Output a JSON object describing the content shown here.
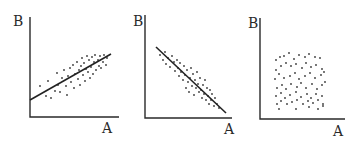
{
  "chart_data": [
    {
      "type": "scatter",
      "title": "",
      "xlabel": "A",
      "ylabel": "B",
      "relationship": "positive correlation",
      "trendline": true,
      "grid": false,
      "frame": {
        "x0": 30,
        "y0": 117,
        "xmax": 119,
        "ytop": 17
      },
      "line": {
        "x1": 30,
        "y1": 100,
        "x2": 111,
        "y2": 54
      },
      "points": [
        [
          40,
          86
        ],
        [
          46,
          96
        ],
        [
          48,
          81
        ],
        [
          51,
          98
        ],
        [
          55,
          91
        ],
        [
          57,
          73
        ],
        [
          58,
          85
        ],
        [
          60,
          92
        ],
        [
          62,
          78
        ],
        [
          64,
          70
        ],
        [
          66,
          86
        ],
        [
          67,
          95
        ],
        [
          68,
          76
        ],
        [
          70,
          68
        ],
        [
          71,
          82
        ],
        [
          73,
          65
        ],
        [
          74,
          88
        ],
        [
          75,
          74
        ],
        [
          77,
          62
        ],
        [
          78,
          79
        ],
        [
          79,
          70
        ],
        [
          80,
          85
        ],
        [
          81,
          66
        ],
        [
          82,
          58
        ],
        [
          83,
          75
        ],
        [
          84,
          63
        ],
        [
          85,
          81
        ],
        [
          86,
          69
        ],
        [
          87,
          56
        ],
        [
          88,
          72
        ],
        [
          89,
          60
        ],
        [
          90,
          78
        ],
        [
          91,
          67
        ],
        [
          92,
          57
        ],
        [
          93,
          74
        ],
        [
          94,
          62
        ],
        [
          95,
          55
        ],
        [
          96,
          70
        ],
        [
          98,
          60
        ],
        [
          99,
          66
        ],
        [
          100,
          56
        ],
        [
          101,
          68
        ],
        [
          103,
          62
        ],
        [
          104,
          55
        ],
        [
          106,
          65
        ],
        [
          107,
          58
        ]
      ]
    },
    {
      "type": "scatter",
      "title": "",
      "xlabel": "A",
      "ylabel": "B",
      "relationship": "negative correlation",
      "trendline": true,
      "grid": false,
      "frame": {
        "x0": 145,
        "y0": 118,
        "xmax": 232,
        "ytop": 15
      },
      "line": {
        "x1": 156,
        "y1": 47,
        "x2": 226,
        "y2": 113
      },
      "points": [
        [
          160,
          55
        ],
        [
          163,
          60
        ],
        [
          165,
          52
        ],
        [
          166,
          64
        ],
        [
          168,
          58
        ],
        [
          170,
          67
        ],
        [
          172,
          56
        ],
        [
          174,
          62
        ],
        [
          175,
          71
        ],
        [
          177,
          60
        ],
        [
          178,
          68
        ],
        [
          179,
          76
        ],
        [
          180,
          63
        ],
        [
          181,
          72
        ],
        [
          183,
          80
        ],
        [
          184,
          66
        ],
        [
          185,
          75
        ],
        [
          186,
          88
        ],
        [
          187,
          70
        ],
        [
          188,
          82
        ],
        [
          189,
          92
        ],
        [
          190,
          78
        ],
        [
          191,
          68
        ],
        [
          192,
          86
        ],
        [
          193,
          74
        ],
        [
          194,
          95
        ],
        [
          195,
          80
        ],
        [
          196,
          88
        ],
        [
          197,
          72
        ],
        [
          198,
          84
        ],
        [
          199,
          92
        ],
        [
          200,
          78
        ],
        [
          201,
          90
        ],
        [
          202,
          98
        ],
        [
          203,
          85
        ],
        [
          204,
          94
        ],
        [
          205,
          80
        ],
        [
          206,
          100
        ],
        [
          207,
          88
        ],
        [
          208,
          96
        ],
        [
          209,
          104
        ],
        [
          210,
          90
        ],
        [
          211,
          100
        ],
        [
          212,
          94
        ],
        [
          214,
          106
        ],
        [
          215,
          98
        ],
        [
          217,
          104
        ],
        [
          219,
          108
        ]
      ]
    },
    {
      "type": "scatter",
      "title": "",
      "xlabel": "A",
      "ylabel": "B",
      "relationship": "no correlation",
      "trendline": false,
      "grid": false,
      "frame": {
        "x0": 260,
        "y0": 119,
        "xmax": 345,
        "ytop": 18
      },
      "line": null,
      "points": [
        [
          276,
          60
        ],
        [
          280,
          57
        ],
        [
          284,
          56
        ],
        [
          289,
          53
        ],
        [
          294,
          59
        ],
        [
          299,
          55
        ],
        [
          305,
          57
        ],
        [
          309,
          54
        ],
        [
          315,
          57
        ],
        [
          320,
          58
        ],
        [
          276,
          70
        ],
        [
          281,
          66
        ],
        [
          286,
          63
        ],
        [
          291,
          66
        ],
        [
          296,
          64
        ],
        [
          302,
          68
        ],
        [
          306,
          63
        ],
        [
          311,
          67
        ],
        [
          316,
          65
        ],
        [
          322,
          69
        ],
        [
          275,
          79
        ],
        [
          279,
          74
        ],
        [
          284,
          78
        ],
        [
          290,
          76
        ],
        [
          295,
          73
        ],
        [
          299,
          79
        ],
        [
          305,
          76
        ],
        [
          310,
          73
        ],
        [
          315,
          78
        ],
        [
          321,
          75
        ],
        [
          324,
          72
        ],
        [
          277,
          88
        ],
        [
          282,
          85
        ],
        [
          286,
          89
        ],
        [
          291,
          84
        ],
        [
          297,
          87
        ],
        [
          301,
          83
        ],
        [
          306,
          88
        ],
        [
          312,
          84
        ],
        [
          317,
          89
        ],
        [
          322,
          85
        ],
        [
          325,
          82
        ],
        [
          276,
          96
        ],
        [
          281,
          93
        ],
        [
          285,
          98
        ],
        [
          290,
          95
        ],
        [
          296,
          92
        ],
        [
          301,
          97
        ],
        [
          307,
          94
        ],
        [
          311,
          98
        ],
        [
          316,
          94
        ],
        [
          322,
          96
        ],
        [
          277,
          104
        ],
        [
          281,
          101
        ],
        [
          287,
          104
        ],
        [
          292,
          102
        ],
        [
          297,
          100
        ],
        [
          303,
          104
        ],
        [
          308,
          101
        ],
        [
          313,
          103
        ],
        [
          318,
          100
        ],
        [
          323,
          104
        ],
        [
          279,
          109
        ],
        [
          296,
          109
        ],
        [
          309,
          107
        ],
        [
          318,
          109
        ],
        [
          323,
          106
        ]
      ]
    }
  ],
  "labels": {
    "chart1": {
      "x": "A",
      "y": "B"
    },
    "chart2": {
      "x": "A",
      "y": "B"
    },
    "chart3": {
      "x": "A",
      "y": "B"
    }
  }
}
